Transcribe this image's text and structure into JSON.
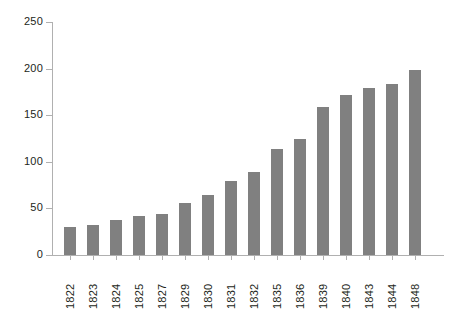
{
  "chart_data": {
    "type": "bar",
    "title": "",
    "subtitle": "",
    "xlabel": "",
    "ylabel": "",
    "categories": [
      "1822",
      "1823",
      "1824",
      "1825",
      "1827",
      "1829",
      "1830",
      "1831",
      "1832",
      "1835",
      "1836",
      "1839",
      "1840",
      "1843",
      "1844",
      "1848"
    ],
    "values": [
      30,
      32,
      38,
      42,
      44,
      56,
      64,
      79,
      89,
      114,
      124,
      159,
      172,
      179,
      184,
      198
    ],
    "series": [
      {
        "name": "",
        "values": [
          30,
          32,
          38,
          42,
          44,
          56,
          64,
          79,
          89,
          114,
          124,
          159,
          172,
          179,
          184,
          198
        ]
      }
    ],
    "ylim": [
      0,
      250
    ],
    "yticks": [
      0,
      50,
      100,
      150,
      200,
      250
    ],
    "ytick_labels": [
      "0",
      "50",
      "100",
      "150",
      "200",
      "250"
    ],
    "grid": false,
    "legend": false,
    "legend_position": "none",
    "bar_color": "#808080",
    "axis_color": "#b0b0b0",
    "text_color": "#231f20",
    "background": "#ffffff",
    "xlabel_rotation": -90
  }
}
